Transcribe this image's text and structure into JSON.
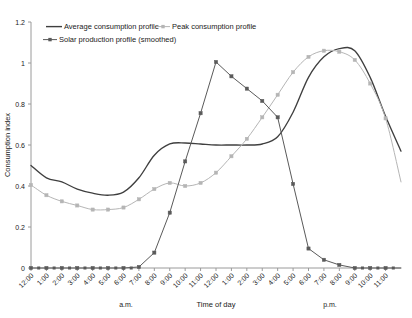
{
  "chart_data": {
    "type": "line",
    "title": "",
    "xlabel": "Time of day",
    "ylabel": "Consumption index",
    "ylim": [
      0,
      1.2
    ],
    "ytick_labels": [
      "0",
      "0.2",
      "0.4",
      "0.6",
      "0.8",
      "1",
      "1.2"
    ],
    "ytick_values": [
      0,
      0.2,
      0.4,
      0.6,
      0.8,
      1.0,
      1.2
    ],
    "grid": false,
    "legend_position": "top-inside",
    "x": [
      "12:00",
      "1:00",
      "2:00",
      "3:00",
      "4:00",
      "5:00",
      "6:00",
      "7:00",
      "8:00",
      "9:00",
      "10:00",
      "11:00",
      "12:00",
      "1:00",
      "2:00",
      "3:00",
      "4:00",
      "5:00",
      "6:00",
      "7:00",
      "8:00",
      "9:00",
      "10:00",
      "11:00"
    ],
    "x_tick_labels": [
      "12:00",
      "1:00",
      "2:00",
      "3:00",
      "4:00",
      "5:00",
      "6:00",
      "7:00",
      "8:00",
      "9:00",
      "10:00",
      "11:00",
      "12:00",
      "1:00",
      "2:00",
      "3:00",
      "4:00",
      "5:00",
      "6:00",
      "7:00",
      "8:00",
      "9:00",
      "10:00",
      "11:00"
    ],
    "period_labels": [
      {
        "text": "a.m.",
        "at": "4:00"
      },
      {
        "text": "p.m.",
        "at": "7:00"
      }
    ],
    "series": [
      {
        "name": "Average consumption profile",
        "color": "#3f3f3f",
        "marker": "none",
        "values": [
          0.5,
          0.44,
          0.42,
          0.385,
          0.365,
          0.355,
          0.37,
          0.44,
          0.55,
          0.605,
          0.61,
          0.605,
          0.6,
          0.6,
          0.6,
          0.605,
          0.64,
          0.76,
          0.93,
          1.03,
          1.07,
          1.06,
          0.93,
          0.74
        ],
        "end_value": 0.57
      },
      {
        "name": "Peak consumption profile",
        "color": "#b5b5b5",
        "marker": "square",
        "values": [
          0.405,
          0.355,
          0.325,
          0.305,
          0.285,
          0.285,
          0.295,
          0.335,
          0.385,
          0.415,
          0.4,
          0.415,
          0.465,
          0.545,
          0.63,
          0.735,
          0.845,
          0.955,
          1.03,
          1.06,
          1.055,
          1.015,
          0.9,
          0.73
        ],
        "end_value": 0.42
      },
      {
        "name": "Solar production profile (smoothed)",
        "color": "#5a5a5a",
        "marker": "square",
        "values": [
          0.0,
          0.0,
          0.0,
          0.0,
          0.0,
          0.0,
          0.0,
          0.005,
          0.075,
          0.27,
          0.52,
          0.755,
          1.005,
          0.935,
          0.875,
          0.815,
          0.735,
          0.41,
          0.095,
          0.04,
          0.015,
          0.0,
          0.0,
          0.0
        ],
        "end_value": 0.0
      }
    ]
  },
  "legend": {
    "items": [
      {
        "label": "Average consumption profile"
      },
      {
        "label": "Peak consumption profile"
      },
      {
        "label": "Solar production profile (smoothed)"
      }
    ]
  }
}
